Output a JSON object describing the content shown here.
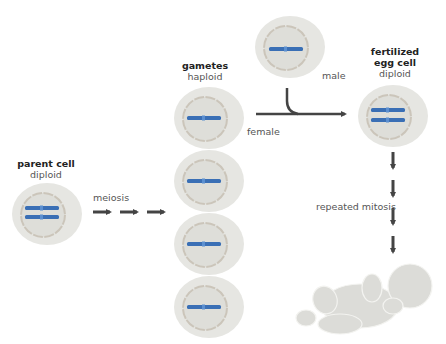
{
  "diagram": {
    "parent_cell": {
      "title": "parent cell",
      "ploidy": "diploid",
      "chromosome_count": 2
    },
    "meiosis_label": "meiosis",
    "gametes": {
      "title": "gametes",
      "ploidy": "haploid",
      "count": 4,
      "chromosome_count": 1
    },
    "male_gamete": {
      "label": "male",
      "chromosome_count": 1
    },
    "female_label": "female",
    "fertilized_egg": {
      "title_line1": "fertilized",
      "title_line2": "egg cell",
      "ploidy": "diploid",
      "chromosome_count": 2
    },
    "mitosis_label": "repeated mitosis",
    "result": "baby",
    "colors": {
      "cell_fill": "#e6e6e2",
      "nucleus_fill": "#deded9",
      "nucleus_ring": "#c9c3b8",
      "chromosome": "#3a6fb5",
      "arrow": "#444444",
      "baby": "#dcdcd8"
    }
  }
}
